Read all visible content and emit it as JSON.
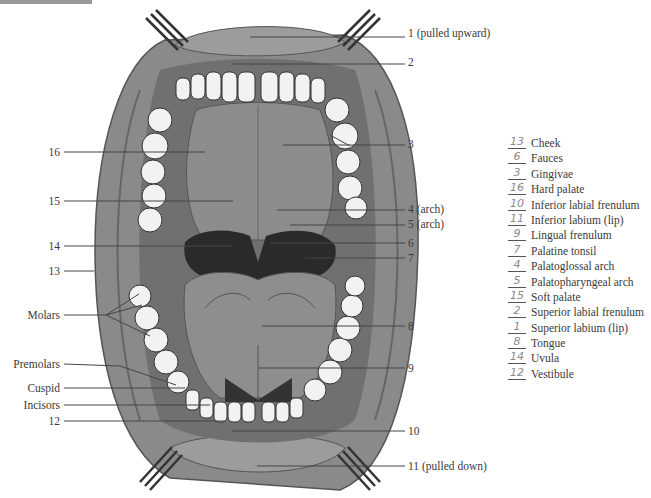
{
  "figure": {
    "callouts_right": [
      {
        "id": "1",
        "text": "1 (pulled upward)",
        "y": 33
      },
      {
        "id": "2",
        "text": "2",
        "y": 62
      },
      {
        "id": "3",
        "text": "3",
        "y": 144
      },
      {
        "id": "4",
        "text": "4 (arch)",
        "y": 209
      },
      {
        "id": "5",
        "text": "5 (arch)",
        "y": 224
      },
      {
        "id": "6",
        "text": "6",
        "y": 243
      },
      {
        "id": "7",
        "text": "7",
        "y": 258
      },
      {
        "id": "8",
        "text": "8",
        "y": 326
      },
      {
        "id": "9",
        "text": "9",
        "y": 368
      },
      {
        "id": "10",
        "text": "10",
        "y": 431
      },
      {
        "id": "11",
        "text": "11 (pulled down)",
        "y": 466
      }
    ],
    "callouts_left": [
      {
        "id": "16",
        "text": "16",
        "y": 152
      },
      {
        "id": "15",
        "text": "15",
        "y": 201
      },
      {
        "id": "14",
        "text": "14",
        "y": 246
      },
      {
        "id": "13",
        "text": "13",
        "y": 271
      },
      {
        "id": "molars",
        "text": "Molars",
        "y": 315
      },
      {
        "id": "premolars",
        "text": "Premolars",
        "y": 364
      },
      {
        "id": "cuspid",
        "text": "Cuspid",
        "y": 388
      },
      {
        "id": "incisors",
        "text": "Incisors",
        "y": 405
      },
      {
        "id": "12",
        "text": "12",
        "y": 421
      }
    ]
  },
  "legend": {
    "items": [
      {
        "answer": "13",
        "term": "Cheek"
      },
      {
        "answer": "6",
        "term": "Fauces"
      },
      {
        "answer": "3",
        "term": "Gingivae"
      },
      {
        "answer": "16",
        "term": "Hard palate"
      },
      {
        "answer": "10",
        "term": "Inferior labial frenulum"
      },
      {
        "answer": "11",
        "term": "Inferior labium (lip)"
      },
      {
        "answer": "9",
        "term": "Lingual frenulum"
      },
      {
        "answer": "7",
        "term": "Palatine tonsil"
      },
      {
        "answer": "4",
        "term": "Palatoglossal arch"
      },
      {
        "answer": "5",
        "term": "Palatopharyngeal arch"
      },
      {
        "answer": "15",
        "term": "Soft palate"
      },
      {
        "answer": "2",
        "term": "Superior labial frenulum"
      },
      {
        "answer": "1",
        "term": "Superior labium (lip)"
      },
      {
        "answer": "8",
        "term": "Tongue"
      },
      {
        "answer": "14",
        "term": "Uvula"
      },
      {
        "answer": "12",
        "term": "Vestibule"
      }
    ]
  },
  "colors": {
    "tissue_dark": "#6e6e6e",
    "tissue_mid": "#8c8c8c",
    "tissue_light": "#a8a8a8",
    "throat": "#2a2a2a",
    "teeth": "#f2f2f2",
    "leader_line": "#444444"
  }
}
